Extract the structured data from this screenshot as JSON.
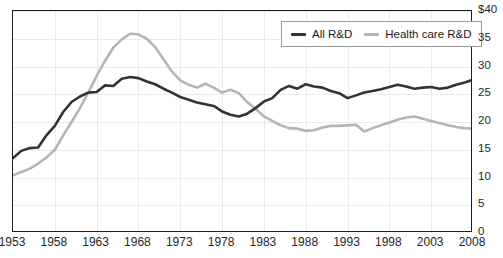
{
  "figure": {
    "title_fragment": "",
    "currency_prefix": "$"
  },
  "legend": {
    "position": "top-right",
    "entries": [
      {
        "label": "All R&D",
        "color": "#333333",
        "key": "all_rd"
      },
      {
        "label": "Health care R&D",
        "color": "#b5b5b5",
        "key": "health_care_rd"
      }
    ]
  },
  "axes": {
    "y_ticks": [
      "$40",
      "35",
      "30",
      "25",
      "20",
      "15",
      "10",
      "5",
      "0"
    ],
    "y_values": [
      40,
      35,
      30,
      25,
      20,
      15,
      10,
      5,
      0
    ],
    "x_ticks": [
      "1953",
      "1958",
      "1963",
      "1968",
      "1973",
      "1978",
      "1983",
      "1988",
      "1993",
      "1998",
      "2003",
      "2008"
    ],
    "x_values": [
      1953,
      1958,
      1963,
      1968,
      1973,
      1978,
      1983,
      1988,
      1993,
      1998,
      2003,
      2008
    ]
  },
  "chart_data": {
    "type": "line",
    "title": "",
    "xlabel": "",
    "ylabel": "",
    "xlim": [
      1953,
      2008
    ],
    "ylim": [
      0,
      40
    ],
    "grid": true,
    "legend_position": "top-right",
    "x": [
      1953,
      1954,
      1955,
      1956,
      1957,
      1958,
      1959,
      1960,
      1961,
      1962,
      1963,
      1964,
      1965,
      1966,
      1967,
      1968,
      1969,
      1970,
      1971,
      1972,
      1973,
      1974,
      1975,
      1976,
      1977,
      1978,
      1979,
      1980,
      1981,
      1982,
      1983,
      1984,
      1985,
      1986,
      1987,
      1988,
      1989,
      1990,
      1991,
      1992,
      1993,
      1994,
      1995,
      1996,
      1997,
      1998,
      1999,
      2000,
      2001,
      2002,
      2003,
      2004,
      2005,
      2006,
      2007,
      2008
    ],
    "series": [
      {
        "name": "All R&D",
        "color": "#333333",
        "values": [
          13.5,
          14.8,
          15.3,
          15.4,
          17.6,
          19.3,
          21.8,
          23.6,
          24.6,
          25.3,
          25.4,
          26.6,
          26.5,
          27.8,
          28.1,
          27.9,
          27.3,
          26.8,
          26.0,
          25.3,
          24.5,
          24.0,
          23.5,
          23.2,
          22.9,
          21.9,
          21.3,
          21.0,
          21.5,
          22.5,
          23.7,
          24.3,
          25.8,
          26.5,
          26.0,
          26.8,
          26.4,
          26.2,
          25.6,
          25.2,
          24.3,
          24.8,
          25.3,
          25.6,
          25.9,
          26.3,
          26.7,
          26.4,
          26.0,
          26.2,
          26.3,
          26.0,
          26.2,
          26.7,
          27.1,
          27.6
        ]
      },
      {
        "name": "Health care R&D",
        "color": "#b5b5b5",
        "values": [
          10.4,
          11.0,
          11.6,
          12.5,
          13.6,
          15.0,
          17.6,
          20.0,
          22.5,
          25.3,
          28.3,
          31.0,
          33.4,
          34.9,
          35.9,
          35.8,
          35.0,
          33.5,
          31.3,
          29.1,
          27.5,
          26.7,
          26.2,
          26.9,
          26.2,
          25.3,
          25.8,
          25.2,
          23.6,
          22.4,
          21.0,
          20.2,
          19.4,
          18.9,
          18.8,
          18.4,
          18.5,
          19.0,
          19.3,
          19.3,
          19.4,
          19.5,
          18.3,
          18.9,
          19.4,
          19.9,
          20.4,
          20.8,
          21.0,
          20.6,
          20.2,
          19.8,
          19.4,
          19.1,
          18.9,
          18.8
        ]
      }
    ]
  }
}
